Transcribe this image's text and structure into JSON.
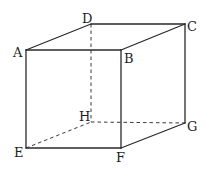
{
  "diagram": {
    "stroke_color": "#2a2a2a",
    "vertices": {
      "A": {
        "label": "A",
        "x": 26,
        "y": 50
      },
      "B": {
        "label": "B",
        "x": 121,
        "y": 50
      },
      "C": {
        "label": "C",
        "x": 185,
        "y": 24
      },
      "D": {
        "label": "D",
        "x": 91,
        "y": 24
      },
      "E": {
        "label": "E",
        "x": 26,
        "y": 148
      },
      "F": {
        "label": "F",
        "x": 121,
        "y": 148
      },
      "G": {
        "label": "G",
        "x": 185,
        "y": 123
      },
      "H": {
        "label": "H",
        "x": 91,
        "y": 122
      }
    },
    "visible_edges": [
      "AB",
      "BC",
      "CD",
      "DA",
      "AE",
      "BF",
      "CG",
      "EF",
      "FG"
    ],
    "hidden_edges": [
      "DH",
      "EH",
      "HG"
    ],
    "labels": {
      "A": "A",
      "B": "B",
      "C": "C",
      "D": "D",
      "E": "E",
      "F": "F",
      "G": "G",
      "H": "H"
    }
  }
}
